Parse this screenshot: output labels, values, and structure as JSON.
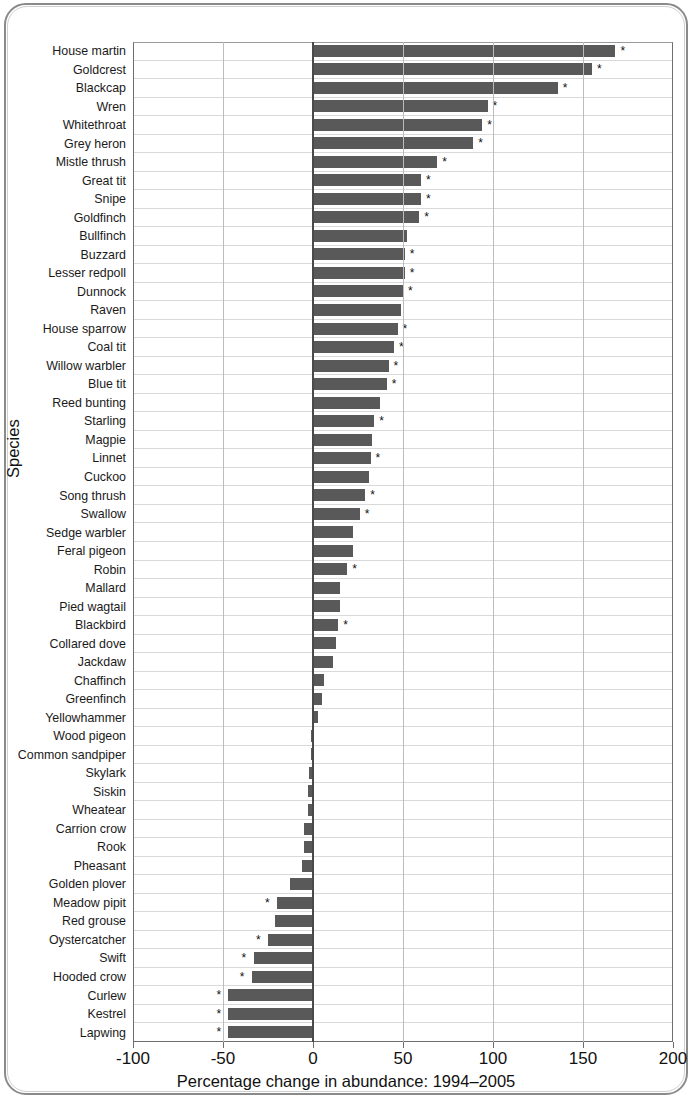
{
  "chart_data": {
    "type": "bar",
    "orientation": "horizontal",
    "title": "",
    "xlabel": "Percentage change in abundance: 1994–2005",
    "ylabel": "Species",
    "xlim": [
      -100,
      200
    ],
    "xticks": [
      -100,
      -50,
      0,
      50,
      100,
      150,
      200
    ],
    "xticklabels": [
      "-100",
      "-50",
      "0",
      "50",
      "100",
      "150",
      "200"
    ],
    "grid": true,
    "grid_axis": "both",
    "legend": null,
    "bar_color": "#595959",
    "annotation_symbol": "*",
    "annotation_meaning": "significant change",
    "categories": [
      "House martin",
      "Goldcrest",
      "Blackcap",
      "Wren",
      "Whitethroat",
      "Grey heron",
      "Mistle thrush",
      "Great tit",
      "Snipe",
      "Goldfinch",
      "Bullfinch",
      "Buzzard",
      "Lesser redpoll",
      "Dunnock",
      "Raven",
      "House sparrow",
      "Coal tit",
      "Willow warbler",
      "Blue tit",
      "Reed bunting",
      "Starling",
      "Magpie",
      "Linnet",
      "Cuckoo",
      "Song thrush",
      "Swallow",
      "Sedge warbler",
      "Feral pigeon",
      "Robin",
      "Mallard",
      "Pied wagtail",
      "Blackbird",
      "Collared dove",
      "Jackdaw",
      "Chaffinch",
      "Greenfinch",
      "Yellowhammer",
      "Wood pigeon",
      "Common sandpiper",
      "Skylark",
      "Siskin",
      "Wheatear",
      "Carrion crow",
      "Rook",
      "Pheasant",
      "Golden plover",
      "Meadow pipit",
      "Red grouse",
      "Oystercatcher",
      "Swift",
      "Hooded crow",
      "Curlew",
      "Kestrel",
      "Lapwing"
    ],
    "values": [
      168,
      155,
      136,
      97,
      94,
      89,
      69,
      60,
      60,
      59,
      52,
      51,
      51,
      50,
      49,
      47,
      45,
      42,
      41,
      37,
      34,
      33,
      32,
      31,
      29,
      26,
      22,
      22,
      19,
      15,
      15,
      14,
      13,
      11,
      6,
      5,
      3,
      -1,
      -1,
      -2,
      -3,
      -3,
      -5,
      -5,
      -6,
      -13,
      -20,
      -21,
      -25,
      -33,
      -34,
      -47,
      -47,
      -47
    ],
    "significant": [
      true,
      true,
      true,
      true,
      true,
      true,
      true,
      true,
      true,
      true,
      false,
      true,
      true,
      true,
      false,
      true,
      true,
      true,
      true,
      false,
      true,
      false,
      true,
      false,
      true,
      true,
      false,
      false,
      true,
      false,
      false,
      true,
      false,
      false,
      false,
      false,
      false,
      false,
      false,
      false,
      false,
      false,
      false,
      false,
      false,
      false,
      true,
      false,
      true,
      true,
      true,
      true,
      true,
      true
    ]
  }
}
